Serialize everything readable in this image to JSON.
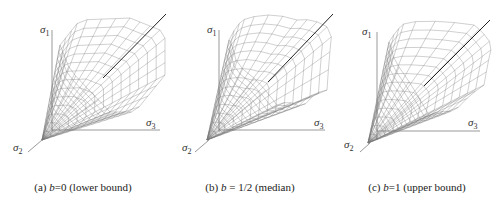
{
  "figure": {
    "panels": [
      {
        "id": "a",
        "caption_prefix": "(a)",
        "b_value": "0",
        "caption_suffix": "(lower bound)",
        "sigma1": "σ",
        "sigma2": "σ",
        "sigma3": "σ",
        "sub1": "1",
        "sub2": "2",
        "sub3": "3"
      },
      {
        "id": "b",
        "caption_prefix": "(b)",
        "b_value": "1/2",
        "caption_suffix": "(median)",
        "sigma1": "σ",
        "sigma2": "σ",
        "sigma3": "σ",
        "sub1": "1",
        "sub2": "2",
        "sub3": "3"
      },
      {
        "id": "c",
        "caption_prefix": "(c)",
        "b_value": "1",
        "caption_suffix": "(upper bound)",
        "sigma1": "σ",
        "sigma2": "σ",
        "sigma3": "σ",
        "sub1": "1",
        "sub2": "2",
        "sub3": "3"
      }
    ],
    "b_symbol": "b",
    "equals": "="
  }
}
